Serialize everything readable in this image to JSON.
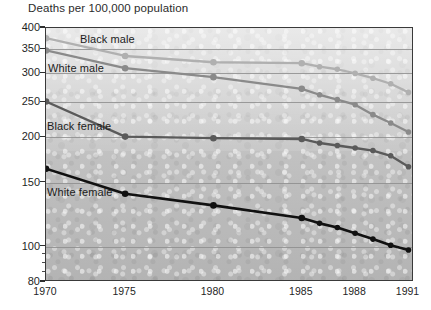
{
  "chart_data": {
    "type": "line",
    "title": "Deaths per 100,000 population",
    "xlabel": "",
    "ylabel": "",
    "yscale": "log",
    "ylim": [
      80,
      400
    ],
    "grid": true,
    "legend": "inline-labels",
    "ytick_labels": [
      "400",
      "350",
      "300",
      "250",
      "200",
      "150",
      "100",
      "80"
    ],
    "ytick_values": [
      400,
      350,
      300,
      250,
      200,
      150,
      100,
      80
    ],
    "yminor_values": [
      95,
      90,
      85
    ],
    "xtick_labels": [
      "1970",
      "1975",
      "1980",
      "1985",
      "1988",
      "1991"
    ],
    "x": [
      1970,
      1975,
      1980,
      1985,
      1986,
      1987,
      1988,
      1989,
      1990,
      1991
    ],
    "series": [
      {
        "name": "Black male",
        "color": "#b0b0b0",
        "label_x": 80,
        "label_y": 33,
        "values": [
          375,
          335,
          322,
          320,
          313,
          308,
          300,
          291,
          281,
          266
        ]
      },
      {
        "name": "White male",
        "color": "#8a8a8a",
        "label_x": 48,
        "label_y": 62,
        "values": [
          347,
          310,
          293,
          272,
          262,
          254,
          246,
          231,
          219,
          207
        ]
      },
      {
        "name": "Black female",
        "color": "#5a5a5a",
        "label_x": 47,
        "label_y": 120,
        "values": [
          251,
          201,
          199,
          198,
          193,
          190,
          187,
          184,
          178,
          166
        ]
      },
      {
        "name": "White female",
        "color": "#111111",
        "label_x": 47,
        "label_y": 186,
        "values": [
          164,
          140,
          130,
          120,
          116,
          113,
          109,
          105,
          101,
          98
        ]
      }
    ]
  },
  "footnote": {
    "text": ""
  }
}
